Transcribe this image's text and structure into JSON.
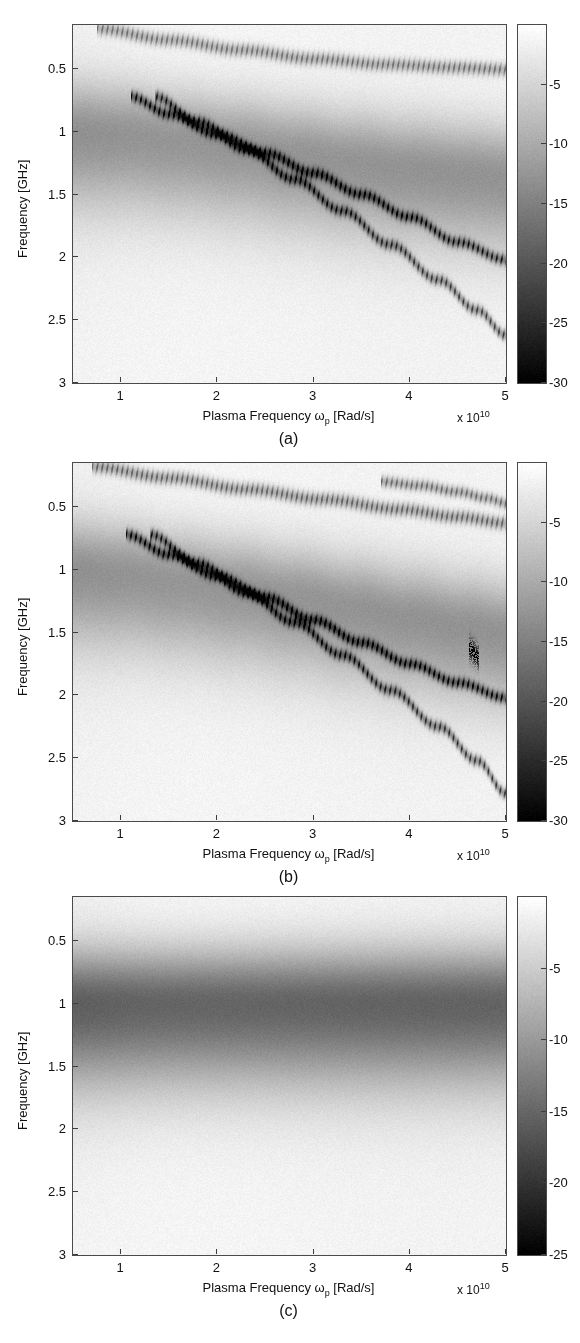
{
  "figure": {
    "width": 580,
    "height": 1343,
    "background": "#ffffff",
    "axis_color": "#4a4a4a",
    "text_color": "#111111"
  },
  "common": {
    "xlabel_text_prefix": "Plasma Frequency ",
    "xlabel_omega": "ω",
    "xlabel_omega_sub": "p",
    "xlabel_text_suffix": " [Rad/s]",
    "ylabel": "Frequency [GHz]",
    "x_multiplier_prefix": "x 10",
    "x_multiplier_exponent": "10",
    "xticks": [
      1,
      2,
      3,
      4,
      5
    ],
    "xticklabels": [
      "1",
      "2",
      "3",
      "4",
      "5"
    ],
    "yticks": [
      0.5,
      1,
      1.5,
      2,
      2.5,
      3
    ],
    "yticklabels": [
      "0.5",
      "1",
      "1.5",
      "2",
      "2.5",
      "3"
    ],
    "xlim": [
      0.5,
      5.0
    ],
    "ylim": [
      0.15,
      3.0
    ],
    "y_axis_inverted": true,
    "colormap": "gray_reversed_white_to_black"
  },
  "panels": [
    {
      "id": "a",
      "caption": "(a)",
      "box": {
        "x": 72,
        "y": 24,
        "w": 433,
        "h": 358
      },
      "colorbar": {
        "x": 517,
        "y": 24,
        "w": 28,
        "h": 358
      },
      "colorbar_ticks": [
        -5,
        -10,
        -15,
        -20,
        -25,
        -30
      ],
      "colorbar_ticklabels": [
        "-5",
        "-10",
        "-15",
        "-20",
        "-25",
        "-30"
      ],
      "colorbar_range": [
        0,
        -30
      ]
    },
    {
      "id": "b",
      "caption": "(b)",
      "box": {
        "x": 72,
        "y": 462,
        "w": 433,
        "h": 358
      },
      "colorbar": {
        "x": 517,
        "y": 462,
        "w": 28,
        "h": 358
      },
      "colorbar_ticks": [
        -5,
        -10,
        -15,
        -20,
        -25,
        -30
      ],
      "colorbar_ticklabels": [
        "-5",
        "-10",
        "-15",
        "-20",
        "-25",
        "-30"
      ],
      "colorbar_range": [
        0,
        -30
      ]
    },
    {
      "id": "c",
      "caption": "(c)",
      "box": {
        "x": 72,
        "y": 896,
        "w": 433,
        "h": 358
      },
      "colorbar": {
        "x": 517,
        "y": 896,
        "w": 28,
        "h": 358
      },
      "colorbar_ticks": [
        -5,
        -10,
        -15,
        -20,
        -25
      ],
      "colorbar_ticklabels": [
        "-5",
        "-10",
        "-15",
        "-20",
        "-25"
      ],
      "colorbar_range": [
        0,
        -25
      ]
    }
  ],
  "chart_data": {
    "type": "heatmap",
    "title": "",
    "xlabel": "Plasma Frequency ωp [Rad/s]",
    "ylabel": "Frequency [GHz]",
    "xlim": [
      0.5,
      5.0
    ],
    "ylim": [
      0.15,
      3.0
    ],
    "x_unit_multiplier": 10000000000.0,
    "y_unit": "GHz",
    "z_unit": "dB",
    "grid": false,
    "legend": null,
    "panels": [
      {
        "id": "a",
        "caption": "(a)",
        "zlim": [
          0,
          -30
        ],
        "cbar_ticks": [
          -5,
          -10,
          -15,
          -20,
          -25,
          -30
        ],
        "background_level_db": -1.5,
        "features": [
          {
            "name": "upper-dispersion-branch",
            "style": "sharp-dotted",
            "depth_db": -16,
            "width_ghz": 0.035,
            "points": [
              [
                0.75,
                0.18
              ],
              [
                1.5,
                0.27
              ],
              [
                2.25,
                0.35
              ],
              [
                3.0,
                0.42
              ],
              [
                3.75,
                0.465
              ],
              [
                4.5,
                0.49
              ],
              [
                5.0,
                0.505
              ]
            ]
          },
          {
            "name": "broad-resonance-band",
            "style": "broad-diffuse",
            "depth_db": -11,
            "width_ghz": 0.22,
            "points": [
              [
                0.5,
                1.0
              ],
              [
                1.0,
                1.02
              ],
              [
                1.6,
                1.07
              ],
              [
                2.2,
                1.12
              ],
              [
                2.8,
                1.18
              ],
              [
                3.4,
                1.24
              ],
              [
                4.0,
                1.29
              ],
              [
                4.6,
                1.33
              ],
              [
                5.0,
                1.36
              ]
            ]
          },
          {
            "name": "first-steep-dotted-branch",
            "style": "sharp-dotted",
            "depth_db": -24,
            "width_ghz": 0.03,
            "points": [
              [
                1.1,
                0.72
              ],
              [
                1.5,
                0.86
              ],
              [
                2.0,
                1.02
              ],
              [
                2.5,
                1.17
              ],
              [
                3.0,
                1.33
              ],
              [
                3.5,
                1.5
              ],
              [
                4.0,
                1.68
              ],
              [
                4.5,
                1.88
              ],
              [
                5.0,
                2.02
              ]
            ]
          },
          {
            "name": "second-steep-dotted-branch",
            "style": "sharp-dotted",
            "depth_db": -22,
            "width_ghz": 0.03,
            "points": [
              [
                1.35,
                0.72
              ],
              [
                1.8,
                0.92
              ],
              [
                2.3,
                1.14
              ],
              [
                2.8,
                1.38
              ],
              [
                3.3,
                1.63
              ],
              [
                3.8,
                1.9
              ],
              [
                4.3,
                2.18
              ],
              [
                4.7,
                2.42
              ],
              [
                5.0,
                2.62
              ]
            ]
          }
        ]
      },
      {
        "id": "b",
        "caption": "(b)",
        "zlim": [
          0,
          -30
        ],
        "cbar_ticks": [
          -5,
          -10,
          -15,
          -20,
          -25,
          -30
        ],
        "background_level_db": -1.5,
        "features": [
          {
            "name": "upper-dispersion-branch",
            "style": "sharp-dotted",
            "depth_db": -18,
            "width_ghz": 0.035,
            "points": [
              [
                0.7,
                0.18
              ],
              [
                1.5,
                0.27
              ],
              [
                2.3,
                0.36
              ],
              [
                3.1,
                0.44
              ],
              [
                3.9,
                0.52
              ],
              [
                4.5,
                0.58
              ],
              [
                5.0,
                0.63
              ]
            ]
          },
          {
            "name": "upper-split-branch",
            "style": "sharp-dotted",
            "depth_db": -17,
            "width_ghz": 0.03,
            "points": [
              [
                3.7,
                0.3
              ],
              [
                4.1,
                0.33
              ],
              [
                4.5,
                0.38
              ],
              [
                4.8,
                0.43
              ],
              [
                5.0,
                0.47
              ]
            ]
          },
          {
            "name": "broad-resonance-band",
            "style": "broad-diffuse",
            "depth_db": -11,
            "width_ghz": 0.22,
            "points": [
              [
                0.5,
                1.0
              ],
              [
                1.0,
                1.03
              ],
              [
                1.6,
                1.09
              ],
              [
                2.2,
                1.15
              ],
              [
                2.8,
                1.22
              ],
              [
                3.4,
                1.3
              ],
              [
                4.0,
                1.38
              ],
              [
                4.6,
                1.45
              ],
              [
                5.0,
                1.5
              ]
            ]
          },
          {
            "name": "first-steep-dotted-branch",
            "style": "sharp-dotted",
            "depth_db": -25,
            "width_ghz": 0.03,
            "points": [
              [
                1.05,
                0.72
              ],
              [
                1.5,
                0.88
              ],
              [
                2.0,
                1.05
              ],
              [
                2.5,
                1.22
              ],
              [
                3.0,
                1.4
              ],
              [
                3.5,
                1.58
              ],
              [
                4.0,
                1.75
              ],
              [
                4.5,
                1.9
              ],
              [
                5.0,
                2.02
              ]
            ]
          },
          {
            "name": "second-steep-dotted-branch",
            "style": "sharp-dotted",
            "depth_db": -23,
            "width_ghz": 0.03,
            "points": [
              [
                1.3,
                0.72
              ],
              [
                1.8,
                0.95
              ],
              [
                2.3,
                1.18
              ],
              [
                2.8,
                1.42
              ],
              [
                3.3,
                1.68
              ],
              [
                3.8,
                1.96
              ],
              [
                4.3,
                2.25
              ],
              [
                4.7,
                2.52
              ],
              [
                5.0,
                2.78
              ]
            ]
          },
          {
            "name": "isolated-speckle-patch",
            "style": "speckle",
            "depth_db": -20,
            "width_ghz": 0.06,
            "points": [
              [
                4.62,
                1.63
              ],
              [
                4.72,
                1.7
              ]
            ]
          }
        ]
      },
      {
        "id": "c",
        "caption": "(c)",
        "zlim": [
          0,
          -25
        ],
        "cbar_ticks": [
          -5,
          -10,
          -15,
          -20,
          -25
        ],
        "background_level_db": -1.2,
        "features": [
          {
            "name": "flat-resonance-band",
            "style": "broad-diffuse",
            "depth_db": -14,
            "width_ghz": 0.24,
            "points": [
              [
                0.5,
                1.0
              ],
              [
                1.5,
                1.0
              ],
              [
                2.5,
                1.0
              ],
              [
                3.5,
                1.0
              ],
              [
                4.5,
                1.0
              ],
              [
                5.0,
                1.0
              ]
            ]
          }
        ]
      }
    ]
  }
}
